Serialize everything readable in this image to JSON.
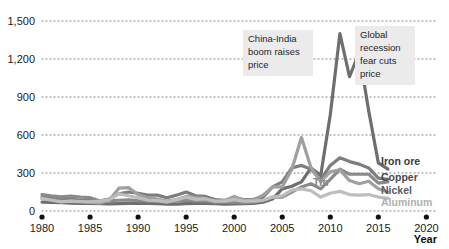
{
  "chart_data": {
    "type": "line",
    "title": "",
    "subtitle": "",
    "xlabel": "Year",
    "ylabel": "",
    "xlim": [
      1980,
      2021
    ],
    "ylim": [
      0,
      1500
    ],
    "grid": true,
    "legend_position": "right-inline",
    "y_ticks": [
      "0",
      "300",
      "600",
      "900",
      "1,200",
      "1,500"
    ],
    "y_tick_values": [
      0,
      300,
      600,
      900,
      1200,
      1500
    ],
    "x_ticks": [
      "1980",
      "1985",
      "1990",
      "1995",
      "2000",
      "2005",
      "2010",
      "2015",
      "2020"
    ],
    "x_tick_values": [
      1980,
      1985,
      1990,
      1995,
      2000,
      2005,
      2010,
      2015,
      2020
    ],
    "x": [
      1980,
      1981,
      1982,
      1983,
      1984,
      1985,
      1986,
      1987,
      1988,
      1989,
      1990,
      1991,
      1992,
      1993,
      1994,
      1995,
      1996,
      1997,
      1998,
      1999,
      2000,
      2001,
      2002,
      2003,
      2004,
      2005,
      2006,
      2007,
      2008,
      2009,
      2010,
      2011,
      2012,
      2013,
      2014,
      2015,
      2016
    ],
    "series": [
      {
        "name": "Iron ore",
        "color": "#6e6e6e",
        "values": [
          70,
          68,
          66,
          62,
          60,
          60,
          58,
          57,
          58,
          60,
          62,
          60,
          58,
          55,
          55,
          58,
          60,
          60,
          58,
          55,
          56,
          58,
          60,
          70,
          95,
          175,
          195,
          230,
          340,
          280,
          760,
          1400,
          1060,
          1250,
          790,
          380,
          330
        ]
      },
      {
        "name": "Copper",
        "color": "#7d7d7d",
        "values": [
          110,
          100,
          88,
          95,
          85,
          82,
          80,
          95,
          135,
          150,
          140,
          125,
          125,
          105,
          125,
          150,
          120,
          115,
          90,
          85,
          100,
          90,
          92,
          110,
          190,
          230,
          340,
          360,
          330,
          245,
          360,
          420,
          390,
          370,
          340,
          260,
          250
        ]
      },
      {
        "name": "Tin",
        "color": "#8a8a8a",
        "values": [
          130,
          120,
          112,
          118,
          110,
          105,
          80,
          82,
          85,
          88,
          82,
          78,
          75,
          70,
          78,
          85,
          80,
          78,
          72,
          70,
          72,
          65,
          70,
          80,
          110,
          110,
          150,
          190,
          215,
          175,
          250,
          330,
          290,
          290,
          290,
          220,
          230
        ]
      },
      {
        "name": "Nickel",
        "color": "#a0a0a0",
        "values": [
          95,
          88,
          75,
          78,
          72,
          70,
          62,
          85,
          180,
          185,
          130,
          105,
          95,
          78,
          90,
          115,
          105,
          100,
          72,
          82,
          115,
          85,
          88,
          125,
          190,
          190,
          330,
          580,
          340,
          230,
          310,
          325,
          240,
          215,
          235,
          175,
          150
        ]
      },
      {
        "name": "Aluminum",
        "color": "#bdbdbd",
        "values": [
          100,
          85,
          72,
          78,
          75,
          72,
          78,
          90,
          135,
          120,
          105,
          85,
          82,
          72,
          88,
          110,
          92,
          95,
          80,
          78,
          90,
          78,
          78,
          85,
          110,
          120,
          165,
          175,
          160,
          110,
          140,
          155,
          130,
          125,
          130,
          110,
          100
        ]
      }
    ],
    "annotations": [
      {
        "id": "annotation-china-india",
        "lines": [
          "China-India",
          "boom raises",
          "price"
        ],
        "text": "China-India boom raises price"
      },
      {
        "id": "annotation-global-recession",
        "lines": [
          "Global",
          "recession",
          "fear cuts",
          "price"
        ],
        "text": "Global recession fear cuts price"
      }
    ],
    "series_labels": [
      {
        "name": "Iron ore",
        "color": "#3a3a3a"
      },
      {
        "name": "Copper",
        "color": "#4a4a4a"
      },
      {
        "name": "Nickel",
        "color": "#5a5a5a"
      },
      {
        "name": "Aluminum",
        "color": "#b0b0b0"
      }
    ],
    "inline_labels": [
      {
        "name": "Tin",
        "color": "#8a8a8a"
      }
    ]
  }
}
